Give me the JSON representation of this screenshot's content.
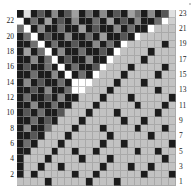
{
  "figure": {
    "title": "",
    "type": "heatmap-matrix"
  },
  "axes": {
    "left": {
      "name": "left-axis",
      "ticks": [
        22,
        20,
        18,
        16,
        14,
        12,
        10,
        8,
        6,
        4,
        2
      ]
    },
    "right": {
      "name": "right-axis",
      "ticks": [
        23,
        21,
        19,
        17,
        15,
        13,
        11,
        9,
        7,
        5,
        3,
        1
      ]
    }
  },
  "colors": {
    "background": "#ffffff",
    "grid_line": "#969696",
    "white": "#ffffff",
    "very_light": "#d2d2d2",
    "light": "#bebebe",
    "mid_light": "#9b9b9b",
    "mid": "#7d7d7d",
    "mid_dark": "#5e5e5e",
    "dark": "#3c3c3c",
    "very_dark": "#1e1e1e",
    "black": "#0d0d0d"
  },
  "chart_data": {
    "type": "heatmap",
    "title": "",
    "xlabel": "",
    "ylabel": "",
    "rows": 23,
    "cols": 23,
    "row_labels_left": [
      22,
      20,
      18,
      16,
      14,
      12,
      10,
      8,
      6,
      4,
      2
    ],
    "row_labels_right": [
      23,
      21,
      19,
      17,
      15,
      13,
      11,
      9,
      7,
      5,
      3,
      1
    ],
    "grid": true,
    "legend": "none",
    "value_range": [
      0,
      9
    ],
    "colormap": "grayscale",
    "note": "Row index 0 is the top row (label 23); row index 22 is the bottom row (label 1). Values 0=white .. 9=black.",
    "values": [
      [
        9,
        1,
        9,
        7,
        9,
        5,
        9,
        7,
        4,
        9,
        6,
        9,
        5,
        9,
        7,
        9,
        4,
        6,
        9,
        5,
        9,
        7,
        1
      ],
      [
        0,
        9,
        6,
        9,
        4,
        9,
        7,
        9,
        5,
        9,
        9,
        6,
        9,
        4,
        9,
        7,
        9,
        5,
        9,
        9,
        6,
        0,
        2
      ],
      [
        6,
        0,
        9,
        5,
        9,
        9,
        6,
        9,
        9,
        4,
        9,
        7,
        9,
        9,
        5,
        9,
        6,
        9,
        9,
        0,
        3,
        3,
        3
      ],
      [
        9,
        6,
        0,
        9,
        7,
        9,
        9,
        5,
        9,
        9,
        6,
        9,
        4,
        9,
        9,
        7,
        9,
        0,
        3,
        3,
        3,
        3,
        3
      ],
      [
        9,
        9,
        6,
        0,
        9,
        6,
        9,
        9,
        7,
        9,
        9,
        5,
        9,
        6,
        9,
        0,
        3,
        3,
        3,
        3,
        3,
        9,
        3
      ],
      [
        9,
        4,
        9,
        6,
        0,
        9,
        5,
        9,
        9,
        6,
        9,
        9,
        7,
        9,
        0,
        3,
        3,
        3,
        3,
        9,
        3,
        3,
        3
      ],
      [
        9,
        9,
        5,
        9,
        6,
        0,
        9,
        7,
        9,
        9,
        5,
        9,
        9,
        0,
        3,
        3,
        3,
        3,
        9,
        3,
        3,
        3,
        3
      ],
      [
        9,
        7,
        9,
        9,
        6,
        9,
        0,
        9,
        6,
        9,
        9,
        7,
        0,
        3,
        3,
        3,
        9,
        3,
        3,
        3,
        3,
        9,
        3
      ],
      [
        9,
        9,
        6,
        9,
        9,
        5,
        9,
        0,
        9,
        6,
        9,
        0,
        3,
        3,
        3,
        9,
        3,
        3,
        3,
        3,
        9,
        3,
        3
      ],
      [
        9,
        5,
        9,
        7,
        9,
        9,
        6,
        9,
        0,
        0,
        0,
        3,
        3,
        3,
        9,
        3,
        3,
        3,
        9,
        3,
        3,
        3,
        3
      ],
      [
        9,
        9,
        7,
        9,
        5,
        9,
        9,
        6,
        0,
        0,
        3,
        3,
        3,
        9,
        3,
        3,
        3,
        3,
        3,
        3,
        9,
        3,
        3
      ],
      [
        9,
        6,
        9,
        9,
        7,
        9,
        5,
        9,
        9,
        3,
        3,
        3,
        9,
        3,
        3,
        3,
        9,
        3,
        3,
        3,
        3,
        3,
        9
      ],
      [
        9,
        9,
        5,
        9,
        9,
        6,
        9,
        9,
        3,
        3,
        3,
        9,
        3,
        3,
        3,
        3,
        3,
        9,
        3,
        3,
        3,
        9,
        3
      ],
      [
        9,
        7,
        9,
        6,
        9,
        9,
        7,
        3,
        3,
        3,
        9,
        3,
        3,
        3,
        9,
        3,
        3,
        3,
        3,
        3,
        9,
        3,
        3
      ],
      [
        9,
        9,
        6,
        9,
        7,
        9,
        3,
        3,
        3,
        9,
        3,
        3,
        3,
        3,
        3,
        9,
        3,
        3,
        9,
        3,
        3,
        3,
        3
      ],
      [
        9,
        5,
        9,
        9,
        6,
        3,
        3,
        3,
        9,
        3,
        3,
        3,
        9,
        3,
        3,
        3,
        3,
        9,
        3,
        3,
        3,
        9,
        3
      ],
      [
        9,
        9,
        7,
        9,
        3,
        3,
        3,
        9,
        3,
        3,
        3,
        3,
        3,
        9,
        3,
        3,
        3,
        3,
        3,
        9,
        3,
        3,
        3
      ],
      [
        9,
        6,
        9,
        3,
        3,
        3,
        9,
        3,
        3,
        3,
        3,
        3,
        9,
        3,
        3,
        9,
        3,
        3,
        3,
        3,
        3,
        3,
        9
      ],
      [
        9,
        9,
        3,
        3,
        3,
        9,
        3,
        3,
        9,
        3,
        3,
        9,
        3,
        3,
        3,
        3,
        3,
        9,
        3,
        3,
        9,
        3,
        3
      ],
      [
        9,
        3,
        3,
        3,
        9,
        3,
        3,
        3,
        3,
        9,
        3,
        3,
        3,
        9,
        3,
        3,
        3,
        3,
        3,
        3,
        3,
        9,
        3
      ],
      [
        9,
        3,
        3,
        9,
        3,
        3,
        9,
        3,
        3,
        3,
        3,
        3,
        9,
        3,
        3,
        3,
        9,
        3,
        3,
        9,
        3,
        3,
        3
      ],
      [
        9,
        3,
        9,
        3,
        3,
        3,
        3,
        3,
        9,
        3,
        3,
        9,
        3,
        3,
        3,
        3,
        3,
        3,
        9,
        3,
        3,
        3,
        9
      ],
      [
        3,
        3,
        3,
        3,
        9,
        3,
        3,
        3,
        3,
        3,
        9,
        3,
        3,
        3,
        9,
        3,
        3,
        3,
        3,
        3,
        3,
        3,
        3
      ]
    ],
    "shades": {
      "0": "#ffffff",
      "1": "#e0e0e0",
      "2": "#cfcfcf",
      "3": "#c2c2c2",
      "4": "#a0a0a0",
      "5": "#8a8a8a",
      "6": "#6f6f6f",
      "7": "#575757",
      "8": "#3a3a3a",
      "9": "#1c1c1c"
    }
  }
}
